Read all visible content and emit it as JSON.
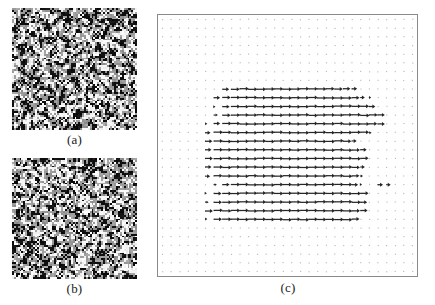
{
  "figure": {
    "caption_labels": {
      "a": "(a)",
      "b": "(b)",
      "c": "(c)"
    }
  },
  "panels": {
    "a": {
      "label": "(a)",
      "kind": "speckle-image",
      "description": "random black-and-white speckle pattern",
      "seed": 11,
      "cell_px": 1.9,
      "black_fraction": 0.5
    },
    "b": {
      "label": "(b)",
      "kind": "speckle-image",
      "description": "random black-and-white speckle pattern",
      "seed": 77,
      "cell_px": 1.9,
      "black_fraction": 0.5
    },
    "c": {
      "label": "(c)",
      "kind": "quiver-plot",
      "description": "displacement vector field on a regular dot grid; rightward arrows over a central elliptical region"
    }
  },
  "chart_data": {
    "type": "scatter",
    "title": "",
    "xlabel": "",
    "ylabel": "",
    "grid": true,
    "legend": "none",
    "axis_box": true,
    "xlim": [
      0,
      30
    ],
    "ylim": [
      0,
      30
    ],
    "grid_cols": 30,
    "grid_rows": 30,
    "dot_color": "#b9b9b9",
    "arrow_color": "#262626",
    "arrow_direction_deg": 0,
    "arrow_rows": [
      {
        "y": 8,
        "x_start": 7,
        "x_end": 22,
        "u": [
          0.75,
          0.95,
          1.0,
          1.0,
          1.0,
          1.0,
          1.0,
          1.0,
          1.0,
          1.0,
          1.0,
          1.0,
          0.95,
          0.9,
          0.8,
          0.6
        ]
      },
      {
        "y": 9,
        "x_start": 6,
        "x_end": 24,
        "u": [
          0.7,
          0.9,
          1.0,
          1.0,
          1.0,
          1.0,
          1.0,
          1.0,
          1.0,
          1.0,
          1.0,
          1.0,
          1.0,
          1.0,
          1.0,
          0.95,
          0.85,
          0.5,
          0.25
        ]
      },
      {
        "y": 10,
        "x_start": 6,
        "x_end": 24,
        "u": [
          0.2,
          0.8,
          1.0,
          1.0,
          1.0,
          1.0,
          1.0,
          1.0,
          1.0,
          1.0,
          1.0,
          1.0,
          1.0,
          1.0,
          1.0,
          1.0,
          1.0,
          0.95,
          0.7
        ]
      },
      {
        "y": 11,
        "x_start": 6,
        "x_end": 25,
        "u": [
          0.45,
          0.9,
          1.0,
          1.0,
          1.0,
          1.0,
          1.0,
          1.0,
          1.0,
          1.0,
          1.0,
          1.0,
          1.0,
          1.0,
          1.0,
          1.0,
          1.0,
          1.0,
          0.95,
          0.8
        ]
      },
      {
        "y": 12,
        "x_start": 5,
        "x_end": 25,
        "u": [
          0.25,
          0.7,
          1.0,
          1.0,
          1.0,
          1.0,
          1.0,
          1.0,
          1.0,
          1.0,
          1.0,
          1.0,
          1.0,
          1.0,
          1.0,
          1.0,
          1.0,
          1.0,
          1.0,
          0.9,
          0.8
        ]
      },
      {
        "y": 13,
        "x_start": 5,
        "x_end": 24,
        "u": [
          0.6,
          1.0,
          1.0,
          1.0,
          1.0,
          1.0,
          1.0,
          1.0,
          1.0,
          1.0,
          1.0,
          1.0,
          1.0,
          1.0,
          1.0,
          1.0,
          1.0,
          1.0,
          0.95,
          0.3
        ]
      },
      {
        "y": 14,
        "x_start": 5,
        "x_end": 22,
        "u": [
          0.8,
          1.0,
          1.0,
          1.0,
          1.0,
          1.0,
          1.0,
          1.0,
          1.0,
          1.0,
          1.0,
          1.0,
          1.0,
          1.0,
          1.0,
          1.0,
          0.9,
          0.55
        ]
      },
      {
        "y": 15,
        "x_start": 5,
        "x_end": 23,
        "u": [
          0.7,
          1.0,
          1.0,
          1.0,
          1.0,
          1.0,
          1.0,
          1.0,
          1.0,
          1.0,
          1.0,
          1.0,
          1.0,
          1.0,
          1.0,
          1.0,
          1.0,
          0.9,
          0.7
        ]
      },
      {
        "y": 16,
        "x_start": 5,
        "x_end": 24,
        "u": [
          0.85,
          1.0,
          1.0,
          1.0,
          1.0,
          1.0,
          1.0,
          1.0,
          1.0,
          1.0,
          1.0,
          1.0,
          1.0,
          1.0,
          1.0,
          1.0,
          1.0,
          1.0,
          0.9
        ]
      },
      {
        "y": 17,
        "x_start": 5,
        "x_end": 24,
        "u": [
          0.7,
          1.0,
          1.0,
          1.0,
          1.0,
          1.0,
          1.0,
          1.0,
          1.0,
          1.0,
          1.0,
          1.0,
          1.0,
          1.0,
          1.0,
          1.0,
          1.0,
          0.9,
          0.5
        ]
      },
      {
        "y": 18,
        "x_start": 5,
        "x_end": 24,
        "u": [
          0.55,
          0.95,
          1.0,
          1.0,
          1.0,
          1.0,
          1.0,
          1.0,
          1.0,
          1.0,
          1.0,
          1.0,
          1.0,
          1.0,
          1.0,
          1.0,
          1.0,
          0.85,
          0.3
        ]
      },
      {
        "y": 19,
        "x_start": 6,
        "x_end": 26,
        "u": [
          0.35,
          0.8,
          1.0,
          1.0,
          1.0,
          1.0,
          1.0,
          1.0,
          1.0,
          1.0,
          1.0,
          1.0,
          1.0,
          1.0,
          1.0,
          1.0,
          0.7,
          0.2,
          0.0,
          0.6,
          0.5
        ]
      },
      {
        "y": 20,
        "x_start": 5,
        "x_end": 24,
        "u": [
          0.2,
          0.85,
          1.0,
          1.0,
          1.0,
          1.0,
          1.0,
          1.0,
          1.0,
          1.0,
          1.0,
          1.0,
          1.0,
          1.0,
          1.0,
          1.0,
          1.0,
          1.0,
          0.9
        ]
      },
      {
        "y": 21,
        "x_start": 5,
        "x_end": 24,
        "u": [
          0.4,
          0.9,
          1.0,
          1.0,
          1.0,
          1.0,
          1.0,
          1.0,
          1.0,
          1.0,
          1.0,
          1.0,
          1.0,
          1.0,
          1.0,
          1.0,
          1.0,
          1.0,
          0.75
        ]
      },
      {
        "y": 22,
        "x_start": 5,
        "x_end": 23,
        "u": [
          0.85,
          1.0,
          1.0,
          1.0,
          1.0,
          1.0,
          1.0,
          1.0,
          1.0,
          1.0,
          1.0,
          1.0,
          1.0,
          1.0,
          1.0,
          1.0,
          1.0,
          0.9,
          0.8
        ]
      },
      {
        "y": 23,
        "x_start": 5,
        "x_end": 22,
        "u": [
          0.25,
          0.9,
          1.0,
          1.0,
          1.0,
          1.0,
          1.0,
          1.0,
          1.0,
          1.0,
          1.0,
          1.0,
          1.0,
          1.0,
          1.0,
          1.0,
          1.0,
          0.85
        ]
      }
    ]
  }
}
